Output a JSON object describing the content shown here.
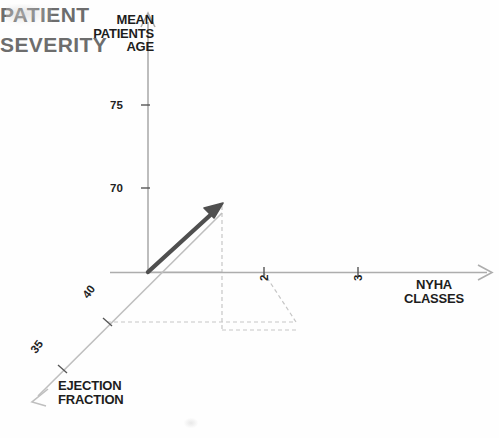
{
  "figure": {
    "type": "diagram",
    "subtype": "3d-axes-vector-diagram",
    "background_color": "#fefefe",
    "annotation": {
      "text_line1": "PATIENT",
      "text_line2": "SEVERITY",
      "color": "#6d6d6d"
    },
    "axes": {
      "vertical": {
        "title_line1": "MEAN",
        "title_line2": "PATIENTS",
        "title_line3": "AGE",
        "ticks": [
          "75",
          "70"
        ],
        "color": "#aaaaaa"
      },
      "horizontal": {
        "title_line1": "NYHA",
        "title_line2": "CLASSES",
        "ticks": [
          "2",
          "3"
        ],
        "color": "#aaaaaa"
      },
      "depth": {
        "title_line1": "EJECTION",
        "title_line2": "FRACTION",
        "ticks": [
          "40",
          "35"
        ],
        "color": "#bbbbbb"
      }
    },
    "vector": {
      "name": "patient-severity-vector",
      "color": "#4a4a4a",
      "start": {
        "x": 148,
        "y": 272
      },
      "end": {
        "x": 222,
        "y": 204
      }
    },
    "projection_lines": {
      "color": "#c2c2c2",
      "style": "dashed"
    }
  }
}
